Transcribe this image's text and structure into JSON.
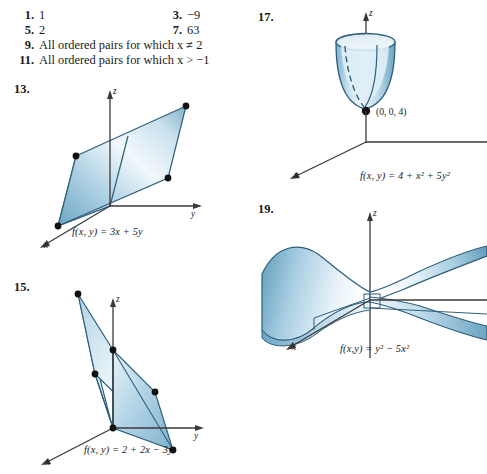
{
  "page": {
    "background": "#ffffff",
    "width": 487,
    "height": 474
  },
  "answers": {
    "rows": [
      {
        "left_num": "1.",
        "left_text": "1",
        "right_num": "3.",
        "right_text": "−9"
      },
      {
        "left_num": "5.",
        "left_text": "2",
        "right_num": "7.",
        "right_text": "63"
      },
      {
        "left_num": "9.",
        "left_text": "All ordered pairs for which x ≠ 2",
        "right_num": "",
        "right_text": ""
      },
      {
        "left_num": "11.",
        "left_text": "All ordered pairs for which x > −1",
        "right_num": "",
        "right_text": ""
      }
    ]
  },
  "figures": [
    {
      "number": "13.",
      "equation": "f(x, y) = 3x + 5y",
      "axis_z": "z",
      "axis_y": "y",
      "axis_x": "x",
      "surface_type": "plane"
    },
    {
      "number": "15.",
      "equation": "f(x, y) = 2 + 2x − 3y",
      "axis_z": "z",
      "axis_y": "y",
      "axis_x": "x",
      "surface_type": "plane"
    },
    {
      "number": "17.",
      "equation": "f(x, y) = 4 + x² + 5y²",
      "axis_z": "z",
      "axis_x": "x",
      "point_label": "(0, 0, 4)",
      "surface_type": "paraboloid"
    },
    {
      "number": "19.",
      "equation": "f(x,y) = y² − 5x²",
      "axis_z": "z",
      "axis_x": "x",
      "surface_type": "saddle"
    }
  ],
  "colors": {
    "surface_light": "#eef6fb",
    "surface_mid": "#9cc4db",
    "surface_dark": "#4f8fae",
    "outline": "#2e5f7a",
    "axis": "#3a3a3a",
    "dot": "#111111",
    "text": "#1a1a1a"
  }
}
